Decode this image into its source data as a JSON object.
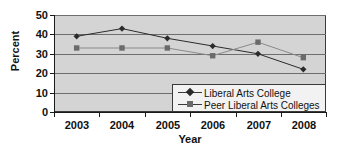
{
  "chart_data": {
    "type": "line",
    "title": "",
    "xlabel": "Year",
    "ylabel": "Percent",
    "categories": [
      "2003",
      "2004",
      "2005",
      "2006",
      "2007",
      "2008"
    ],
    "ylim": [
      0,
      50
    ],
    "yticks": [
      "0",
      "10",
      "20",
      "30",
      "40",
      "50"
    ],
    "grid": true,
    "legend_position": "inside-bottom-right",
    "series": [
      {
        "name": "Liberal Arts College",
        "marker": "diamond",
        "color": "#2b2b2b",
        "values": [
          39,
          43,
          38,
          34,
          30,
          22
        ]
      },
      {
        "name": "Peer Liberal Arts Colleges",
        "marker": "square",
        "color": "#6b6b6b",
        "values": [
          33,
          33,
          33,
          29,
          36,
          28
        ]
      }
    ]
  },
  "colors": {
    "plot_background": "#d4d4d4",
    "gridline": "#6e6e6e",
    "axis": "#1a1a1a",
    "legend_background": "#f2f2f2"
  }
}
